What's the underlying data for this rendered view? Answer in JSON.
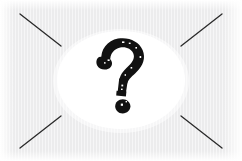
{
  "image": {
    "title": "Question mark illustration",
    "width": 242,
    "height": 161,
    "alt_text": "Bold hand-drawn black question mark inside a white ellipse on a light gray textured background with four diagonal lines converging from the corners"
  },
  "colors": {
    "background": "#ececed",
    "stripe": "#f7f7f8",
    "ellipse": "#ffffff",
    "ink": "#111111",
    "line": "#2b2b2b",
    "page": "#ffffff"
  },
  "background": {
    "name": "textured-gray-field",
    "texture": "vertical-stripes",
    "fill": "#ececed"
  },
  "ellipse": {
    "name": "white-ellipse",
    "cx": 121,
    "cy": 80,
    "rx": 64,
    "ry": 49,
    "fill": "#ffffff"
  },
  "corner_lines": [
    {
      "name": "diagonal-top-left",
      "x1": 20,
      "y1": 14,
      "x2": 61,
      "y2": 46
    },
    {
      "name": "diagonal-top-right",
      "x1": 222,
      "y1": 14,
      "x2": 181,
      "y2": 46
    },
    {
      "name": "diagonal-bottom-left",
      "x1": 20,
      "y1": 148,
      "x2": 61,
      "y2": 116
    },
    {
      "name": "diagonal-bottom-right",
      "x1": 222,
      "y1": 148,
      "x2": 181,
      "y2": 116
    }
  ],
  "glyph": {
    "name": "question-mark",
    "character": "?",
    "style": "brush-drawn-bold",
    "fill": "#111111",
    "hook_bbox": {
      "x": 97,
      "y": 38,
      "w": 46,
      "h": 46
    },
    "stem_bbox": {
      "x": 110,
      "y": 68,
      "w": 18,
      "h": 28
    },
    "dot_bbox": {
      "x": 116,
      "y": 99,
      "w": 14,
      "h": 14
    }
  }
}
